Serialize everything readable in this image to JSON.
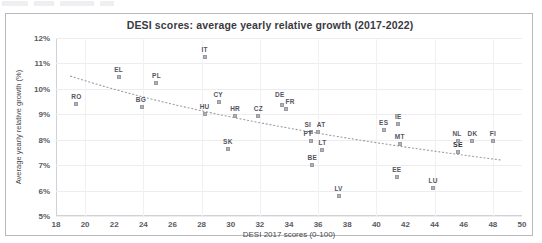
{
  "figure": {
    "title": "DESI scores: average yearly relative growth (2017-2022)",
    "x_axis_title": "DESI 2017 scores (0-100)",
    "y_axis_title": "Average yearly relative growth (%)"
  },
  "chart_data": {
    "type": "scatter",
    "title": "DESI scores: average yearly relative growth (2017-2022)",
    "xlabel": "DESI 2017 scores (0-100)",
    "ylabel": "Average yearly relative growth (%)",
    "xlim": [
      18,
      50
    ],
    "ylim": [
      5,
      12
    ],
    "xticks": [
      18,
      20,
      22,
      24,
      26,
      28,
      30,
      32,
      34,
      36,
      38,
      40,
      42,
      44,
      46,
      48,
      50
    ],
    "yticks": [
      5,
      6,
      7,
      8,
      9,
      10,
      11,
      12
    ],
    "ytick_labels": [
      "5%",
      "6%",
      "7%",
      "8%",
      "9%",
      "10%",
      "11%",
      "12%"
    ],
    "xtick_labels": [
      "18",
      "20",
      "22",
      "24",
      "26",
      "28",
      "30",
      "32",
      "34",
      "36",
      "38",
      "40",
      "42",
      "44",
      "46",
      "48",
      "50"
    ],
    "grid": true,
    "legend": "none",
    "marker": "small grey square",
    "points": [
      {
        "label": "RO",
        "x": 19.4,
        "y": 9.4,
        "label_dx": 0,
        "label_dy": -4
      },
      {
        "label": "EL",
        "x": 22.3,
        "y": 10.45,
        "label_dx": 0,
        "label_dy": -4
      },
      {
        "label": "PL",
        "x": 24.9,
        "y": 10.25,
        "label_dx": 0,
        "label_dy": -4
      },
      {
        "label": "BG",
        "x": 23.9,
        "y": 9.3,
        "label_dx": -1,
        "label_dy": -4
      },
      {
        "label": "IT",
        "x": 28.2,
        "y": 11.25,
        "label_dx": 0,
        "label_dy": -4
      },
      {
        "label": "HU",
        "x": 28.2,
        "y": 9.0,
        "label_dx": 0,
        "label_dy": -4
      },
      {
        "label": "CY",
        "x": 29.2,
        "y": 9.5,
        "label_dx": -1,
        "label_dy": -4
      },
      {
        "label": "SK",
        "x": 29.8,
        "y": 7.65,
        "label_dx": 0,
        "label_dy": -4
      },
      {
        "label": "HR",
        "x": 30.3,
        "y": 8.95,
        "label_dx": 0,
        "label_dy": -4
      },
      {
        "label": "CZ",
        "x": 31.9,
        "y": 8.95,
        "label_dx": 0,
        "label_dy": -4
      },
      {
        "label": "DE",
        "x": 33.5,
        "y": 9.35,
        "label_dx": -2,
        "label_dy": -7
      },
      {
        "label": "FR",
        "x": 33.8,
        "y": 9.2,
        "label_dx": 4,
        "label_dy": -4
      },
      {
        "label": "SI",
        "x": 35.5,
        "y": 8.3,
        "label_dx": -3,
        "label_dy": -4
      },
      {
        "label": "AT",
        "x": 36.0,
        "y": 8.3,
        "label_dx": 3,
        "label_dy": -4
      },
      {
        "label": "PT",
        "x": 35.5,
        "y": 7.95,
        "label_dx": -3,
        "label_dy": -4
      },
      {
        "label": "LT",
        "x": 36.3,
        "y": 7.6,
        "label_dx": 0,
        "label_dy": -4
      },
      {
        "label": "BE",
        "x": 35.6,
        "y": 7.0,
        "label_dx": 0,
        "label_dy": -4
      },
      {
        "label": "LV",
        "x": 37.4,
        "y": 5.8,
        "label_dx": 0,
        "label_dy": -4
      },
      {
        "label": "ES",
        "x": 40.5,
        "y": 8.4,
        "label_dx": 0,
        "label_dy": -4
      },
      {
        "label": "IE",
        "x": 41.5,
        "y": 8.6,
        "label_dx": 0,
        "label_dy": -4
      },
      {
        "label": "MT",
        "x": 41.6,
        "y": 7.85,
        "label_dx": 0,
        "label_dy": -4
      },
      {
        "label": "EE",
        "x": 41.4,
        "y": 6.55,
        "label_dx": 0,
        "label_dy": -4
      },
      {
        "label": "LU",
        "x": 43.9,
        "y": 6.1,
        "label_dx": 0,
        "label_dy": -4
      },
      {
        "label": "SE",
        "x": 45.6,
        "y": 7.5,
        "label_dx": 0,
        "label_dy": -4,
        "label_style": "bold-overlap",
        "label_overlap": true
      },
      {
        "label": "NL",
        "x": 45.6,
        "y": 7.95,
        "label_dx": -1,
        "label_dy": -4
      },
      {
        "label": "DK",
        "x": 46.6,
        "y": 7.95,
        "label_dx": 0,
        "label_dy": -4
      },
      {
        "label": "FI",
        "x": 48.0,
        "y": 7.95,
        "label_dx": 0,
        "label_dy": -4
      }
    ],
    "trendline": {
      "style": "dotted",
      "color": "#9b9ba3",
      "x_start": 19.0,
      "y_start": 10.5,
      "x_end": 48.6,
      "y_end": 7.2,
      "curve": "logarithmic-decreasing"
    }
  }
}
